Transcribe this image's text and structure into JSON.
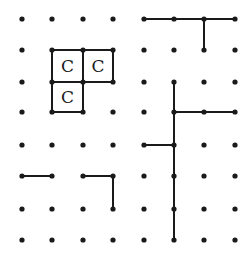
{
  "game": {
    "type": "dots-and-boxes",
    "grid": {
      "cols": 8,
      "rows": 8
    },
    "col_x": [
      22,
      52,
      83,
      113,
      144,
      174,
      204,
      235
    ],
    "row_y": [
      19,
      50,
      82,
      112,
      145,
      176,
      209,
      240
    ],
    "lines": [
      {
        "from": [
          1,
          1
        ],
        "to": [
          2,
          1
        ]
      },
      {
        "from": [
          2,
          1
        ],
        "to": [
          3,
          1
        ]
      },
      {
        "from": [
          1,
          1
        ],
        "to": [
          1,
          2
        ]
      },
      {
        "from": [
          2,
          1
        ],
        "to": [
          2,
          2
        ]
      },
      {
        "from": [
          3,
          1
        ],
        "to": [
          3,
          2
        ]
      },
      {
        "from": [
          1,
          2
        ],
        "to": [
          2,
          2
        ]
      },
      {
        "from": [
          2,
          2
        ],
        "to": [
          3,
          2
        ]
      },
      {
        "from": [
          1,
          2
        ],
        "to": [
          1,
          3
        ]
      },
      {
        "from": [
          2,
          2
        ],
        "to": [
          2,
          3
        ]
      },
      {
        "from": [
          1,
          3
        ],
        "to": [
          2,
          3
        ]
      },
      {
        "from": [
          0,
          5
        ],
        "to": [
          1,
          5
        ]
      },
      {
        "from": [
          2,
          5
        ],
        "to": [
          3,
          5
        ]
      },
      {
        "from": [
          3,
          5
        ],
        "to": [
          3,
          6
        ]
      },
      {
        "from": [
          4,
          0
        ],
        "to": [
          5,
          0
        ]
      },
      {
        "from": [
          5,
          0
        ],
        "to": [
          6,
          0
        ]
      },
      {
        "from": [
          6,
          0
        ],
        "to": [
          7,
          0
        ]
      },
      {
        "from": [
          6,
          0
        ],
        "to": [
          6,
          1
        ]
      },
      {
        "from": [
          5,
          2
        ],
        "to": [
          5,
          3
        ]
      },
      {
        "from": [
          5,
          3
        ],
        "to": [
          5,
          4
        ]
      },
      {
        "from": [
          5,
          4
        ],
        "to": [
          5,
          5
        ]
      },
      {
        "from": [
          5,
          5
        ],
        "to": [
          5,
          6
        ]
      },
      {
        "from": [
          5,
          6
        ],
        "to": [
          5,
          7
        ]
      },
      {
        "from": [
          5,
          3
        ],
        "to": [
          6,
          3
        ]
      },
      {
        "from": [
          6,
          3
        ],
        "to": [
          7,
          3
        ]
      },
      {
        "from": [
          4,
          4
        ],
        "to": [
          5,
          4
        ]
      }
    ],
    "boxes": [
      {
        "col": 1,
        "row": 1,
        "owner": "C"
      },
      {
        "col": 2,
        "row": 1,
        "owner": "C"
      },
      {
        "col": 1,
        "row": 2,
        "owner": "C"
      }
    ]
  }
}
